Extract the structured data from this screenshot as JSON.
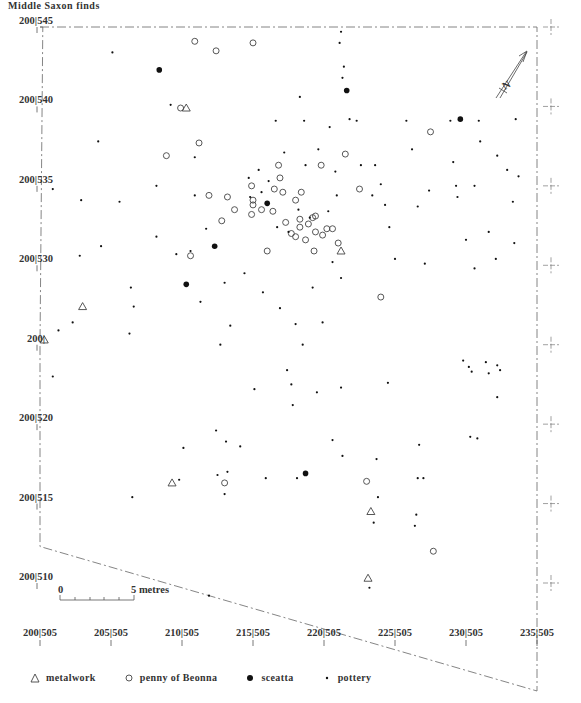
{
  "title": "Middle Saxon finds",
  "scale_bar": {
    "start_label": "0",
    "end_label": "5 metres",
    "length_m": 5
  },
  "north_arrow": {
    "label": "N"
  },
  "legend": [
    {
      "key": "metalwork",
      "label": "metalwork",
      "symbol": "triangle"
    },
    {
      "key": "penny",
      "label": "penny of Beonna",
      "symbol": "open-circle"
    },
    {
      "key": "sceatta",
      "label": "sceatta",
      "symbol": "filled-circle"
    },
    {
      "key": "pottery",
      "label": "pottery",
      "symbol": "dot"
    }
  ],
  "chart_data": {
    "type": "scatter",
    "title": "Middle Saxon finds",
    "xlabel": "Easting",
    "ylabel": "Northing",
    "xlim": [
      200,
      235
    ],
    "ylim": [
      510,
      545
    ],
    "x_ticks": [
      {
        "value": 200,
        "label": "200|505"
      },
      {
        "value": 205,
        "label": "205|505"
      },
      {
        "value": 210,
        "label": "210|505"
      },
      {
        "value": 215,
        "label": "215|505"
      },
      {
        "value": 220,
        "label": "220|505"
      },
      {
        "value": 225,
        "label": "225|505"
      },
      {
        "value": 230,
        "label": "230|505"
      },
      {
        "value": 235,
        "label": "235|505"
      }
    ],
    "y_ticks": [
      {
        "value": 545,
        "label": "200|545"
      },
      {
        "value": 540,
        "label": "200|540"
      },
      {
        "value": 535,
        "label": "200|535"
      },
      {
        "value": 530,
        "label": "200|530"
      },
      {
        "value": 525,
        "label": "200|"
      },
      {
        "value": 520,
        "label": "200|520"
      },
      {
        "value": 515,
        "label": "200|515"
      },
      {
        "value": 510,
        "label": "200|510"
      }
    ],
    "site_boundary": [
      [
        200,
        545
      ],
      [
        235,
        545
      ],
      [
        235,
        503.2
      ],
      [
        200,
        512.3
      ],
      [
        200,
        525
      ],
      [
        200.2,
        545
      ]
    ],
    "series": [
      {
        "name": "metalwork",
        "points": [
          [
            210.3,
            539.9
          ],
          [
            203,
            527.4
          ],
          [
            200.3,
            525.3
          ],
          [
            221.2,
            530.9
          ],
          [
            209.3,
            516.3
          ],
          [
            223.3,
            514.5
          ],
          [
            223.1,
            510.3
          ]
        ]
      },
      {
        "name": "penny of Beonna",
        "points": [
          [
            212.4,
            543.5
          ],
          [
            210.9,
            544.1
          ],
          [
            209.9,
            539.9
          ],
          [
            211.2,
            537.7
          ],
          [
            208.9,
            536.9
          ],
          [
            215.0,
            544.0
          ],
          [
            214.9,
            535.0
          ],
          [
            211.9,
            534.4
          ],
          [
            213.2,
            534.3
          ],
          [
            213.7,
            533.5
          ],
          [
            212.8,
            532.8
          ],
          [
            210.6,
            530.6
          ],
          [
            214.9,
            533.2
          ],
          [
            216.5,
            534.8
          ],
          [
            217.1,
            534.6
          ],
          [
            217.3,
            532.7
          ],
          [
            218.3,
            532.4
          ],
          [
            219.2,
            533.0
          ],
          [
            220.2,
            532.3
          ],
          [
            218.7,
            531.6
          ],
          [
            219.9,
            531.9
          ],
          [
            218.3,
            532.9
          ],
          [
            217.7,
            532.0
          ],
          [
            218.0,
            531.8
          ],
          [
            219.4,
            532.1
          ],
          [
            218.9,
            532.6
          ],
          [
            216.0,
            530.9
          ],
          [
            219.3,
            530.9
          ],
          [
            220.6,
            532.3
          ],
          [
            218.0,
            534.1
          ],
          [
            219.8,
            536.3
          ],
          [
            221.5,
            537.0
          ],
          [
            216.8,
            536.3
          ],
          [
            216.9,
            535.5
          ],
          [
            218.4,
            534.6
          ],
          [
            219.4,
            533.1
          ],
          [
            221.0,
            531.4
          ],
          [
            224.0,
            528.0
          ],
          [
            216.4,
            533.4
          ],
          [
            215.6,
            533.5
          ],
          [
            215.0,
            534.1
          ],
          [
            215.0,
            533.8
          ],
          [
            222.5,
            534.8
          ],
          [
            227.5,
            538.4
          ],
          [
            223.0,
            516.4
          ],
          [
            227.7,
            512.0
          ],
          [
            213.0,
            516.3
          ]
        ]
      },
      {
        "name": "sceatta",
        "points": [
          [
            208.4,
            542.3
          ],
          [
            221.6,
            541.0
          ],
          [
            229.6,
            539.2
          ],
          [
            216.0,
            533.9
          ],
          [
            212.3,
            531.2
          ],
          [
            210.3,
            528.8
          ],
          [
            218.7,
            516.9
          ]
        ]
      },
      {
        "name": "pottery",
        "points": [
          [
            205.1,
            543.4
          ],
          [
            204.1,
            537.8
          ],
          [
            200.9,
            534.8
          ],
          [
            202.9,
            534.1
          ],
          [
            202.8,
            530.6
          ],
          [
            204.3,
            531.2
          ],
          [
            205.6,
            534.0
          ],
          [
            206.4,
            528.6
          ],
          [
            206.6,
            527.4
          ],
          [
            202.3,
            526.4
          ],
          [
            201.3,
            525.9
          ],
          [
            206.3,
            525.7
          ],
          [
            200.9,
            523.0
          ],
          [
            208.2,
            531.8
          ],
          [
            209.6,
            530.7
          ],
          [
            210.6,
            530.9
          ],
          [
            211.7,
            532.3
          ],
          [
            209.2,
            540.1
          ],
          [
            210.9,
            536.8
          ],
          [
            213.0,
            528.9
          ],
          [
            211.3,
            527.7
          ],
          [
            213.4,
            526.2
          ],
          [
            214.4,
            529.5
          ],
          [
            212.7,
            525.0
          ],
          [
            212.4,
            519.6
          ],
          [
            213.1,
            518.9
          ],
          [
            214.1,
            518.6
          ],
          [
            212.5,
            516.8
          ],
          [
            213.0,
            515.6
          ],
          [
            211.9,
            509.2
          ],
          [
            216.6,
            539.1
          ],
          [
            218.6,
            539.1
          ],
          [
            216.1,
            535.3
          ],
          [
            217.2,
            537.1
          ],
          [
            218.3,
            540.6
          ],
          [
            218.7,
            536.3
          ],
          [
            219.6,
            537.3
          ],
          [
            220.4,
            538.7
          ],
          [
            220.9,
            534.4
          ],
          [
            220.8,
            535.9
          ],
          [
            221.3,
            541.8
          ],
          [
            221.4,
            542.5
          ],
          [
            221.2,
            544.7
          ],
          [
            221.1,
            544.0
          ],
          [
            221.8,
            539.2
          ],
          [
            222.3,
            539.1
          ],
          [
            222.6,
            536.3
          ],
          [
            223.6,
            536.3
          ],
          [
            224.0,
            535.1
          ],
          [
            224.3,
            533.8
          ],
          [
            224.6,
            532.4
          ],
          [
            225.0,
            530.4
          ],
          [
            223.4,
            534.4
          ],
          [
            225.8,
            539.1
          ],
          [
            226.2,
            537.3
          ],
          [
            226.6,
            533.7
          ],
          [
            227.4,
            534.7
          ],
          [
            228.9,
            539.1
          ],
          [
            229.1,
            536.5
          ],
          [
            229.3,
            535.0
          ],
          [
            229.4,
            534.3
          ],
          [
            230.0,
            531.6
          ],
          [
            230.6,
            535.0
          ],
          [
            230.9,
            539.1
          ],
          [
            231.0,
            537.8
          ],
          [
            232.2,
            536.9
          ],
          [
            232.9,
            536.0
          ],
          [
            233.3,
            534.0
          ],
          [
            233.7,
            535.6
          ],
          [
            233.5,
            539.2
          ],
          [
            231.6,
            532.1
          ],
          [
            233.4,
            531.4
          ],
          [
            230.6,
            529.8
          ],
          [
            232.1,
            530.4
          ],
          [
            227.1,
            530.1
          ],
          [
            221.2,
            529.2
          ],
          [
            219.9,
            526.4
          ],
          [
            219.2,
            528.6
          ],
          [
            218.5,
            525.0
          ],
          [
            215.7,
            528.3
          ],
          [
            216.9,
            527.3
          ],
          [
            218.0,
            526.3
          ],
          [
            217.4,
            523.4
          ],
          [
            215.1,
            522.2
          ],
          [
            217.7,
            522.5
          ],
          [
            219.5,
            522.0
          ],
          [
            221.2,
            522.3
          ],
          [
            224.5,
            522.6
          ],
          [
            229.8,
            524.0
          ],
          [
            230.2,
            523.6
          ],
          [
            230.4,
            523.3
          ],
          [
            231.4,
            523.9
          ],
          [
            232.2,
            523.7
          ],
          [
            232.4,
            523.4
          ],
          [
            231.6,
            523.2
          ],
          [
            232.2,
            521.7
          ],
          [
            230.3,
            519.2
          ],
          [
            230.8,
            519.1
          ],
          [
            226.7,
            518.7
          ],
          [
            226.6,
            516.6
          ],
          [
            227.0,
            516.6
          ],
          [
            220.6,
            519.0
          ],
          [
            221.3,
            518.0
          ],
          [
            223.7,
            517.8
          ],
          [
            217.8,
            521.2
          ],
          [
            215.9,
            516.6
          ],
          [
            218.1,
            516.6
          ],
          [
            223.8,
            515.4
          ],
          [
            223.5,
            513.8
          ],
          [
            226.5,
            514.3
          ],
          [
            226.4,
            513.6
          ],
          [
            223.2,
            509.7
          ],
          [
            213.2,
            517.0
          ],
          [
            209.8,
            516.5
          ],
          [
            210.1,
            518.5
          ],
          [
            206.5,
            515.4
          ],
          [
            208.2,
            535.0
          ],
          [
            210.9,
            534.4
          ],
          [
            214.8,
            534.3
          ],
          [
            216.7,
            532.4
          ],
          [
            217.5,
            532.1
          ],
          [
            220.3,
            533.4
          ],
          [
            220.6,
            530.2
          ],
          [
            218.2,
            533.5
          ],
          [
            219.0,
            533.0
          ],
          [
            214.7,
            535.5
          ],
          [
            215.4,
            536.0
          ],
          [
            215.6,
            534.6
          ]
        ]
      }
    ]
  }
}
